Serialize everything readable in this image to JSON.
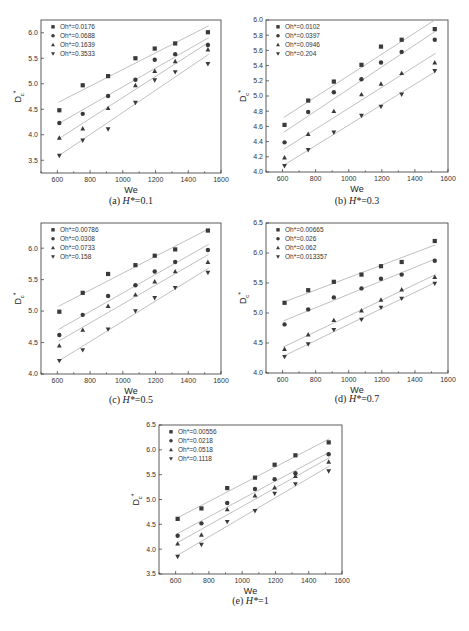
{
  "chart_data": [
    {
      "type": "scatter",
      "panel": "a",
      "caption_prefix": "(a)",
      "caption_var": "H*",
      "caption_value": "=0.1",
      "xlabel": "We",
      "ylabel_main": "D",
      "ylabel_sub": "c",
      "ylabel_sup": "*",
      "xlim": [
        500,
        1600
      ],
      "ylim": [
        3.25,
        6.25
      ],
      "xticks": [
        600,
        800,
        1000,
        1200,
        1400,
        1600
      ],
      "yticks": [
        3.5,
        4.0,
        4.5,
        5.0,
        5.5,
        6.0
      ],
      "ytick_labels": [
        "3.5",
        "4.0",
        "4.5",
        "5.0",
        "5.5",
        "6.0"
      ],
      "legend_position": "top-left",
      "x": [
        612,
        755,
        910,
        1077,
        1195,
        1320,
        1520
      ],
      "series": [
        {
          "name": "Oh*=0.0176",
          "marker": "square",
          "values": [
            4.48,
            4.97,
            5.15,
            5.5,
            5.69,
            5.79,
            6.01
          ]
        },
        {
          "name": "Oh*=0.0688",
          "marker": "circle",
          "values": [
            4.23,
            4.41,
            4.76,
            5.08,
            5.47,
            5.58,
            5.76
          ]
        },
        {
          "name": "Oh*=0.1639",
          "marker": "triangle-up",
          "values": [
            3.94,
            4.12,
            4.52,
            4.97,
            5.25,
            5.44,
            5.67
          ]
        },
        {
          "name": "Oh*=0.3533",
          "marker": "triangle-down",
          "values": [
            3.59,
            3.89,
            4.11,
            4.63,
            5.07,
            5.23,
            5.39
          ]
        }
      ]
    },
    {
      "type": "scatter",
      "panel": "b",
      "caption_prefix": "(b)",
      "caption_var": "H*",
      "caption_value": "=0.3",
      "xlabel": "We",
      "ylabel_main": "D",
      "ylabel_sub": "c",
      "ylabel_sup": "*",
      "xlim": [
        500,
        1600
      ],
      "ylim": [
        4.0,
        6.0
      ],
      "xticks": [
        600,
        800,
        1000,
        1200,
        1400,
        1600
      ],
      "yticks": [
        4.0,
        4.2,
        4.4,
        4.6,
        4.8,
        5.0,
        5.2,
        5.4,
        5.6,
        5.8,
        6.0
      ],
      "ytick_labels": [
        "4.0",
        "4.2",
        "4.4",
        "4.6",
        "4.8",
        "5.0",
        "5.2",
        "5.4",
        "5.6",
        "5.8",
        "6.0"
      ],
      "legend_position": "top-left",
      "x": [
        612,
        755,
        910,
        1077,
        1195,
        1320,
        1520
      ],
      "series": [
        {
          "name": "Oh*=0.0102",
          "marker": "square",
          "values": [
            4.62,
            4.94,
            5.19,
            5.41,
            5.65,
            5.74,
            5.88
          ]
        },
        {
          "name": "Oh*=0.0397",
          "marker": "circle",
          "values": [
            4.39,
            4.79,
            5.05,
            5.22,
            5.44,
            5.58,
            5.74
          ]
        },
        {
          "name": "Oh*=0.0946",
          "marker": "triangle-up",
          "values": [
            4.19,
            4.5,
            4.8,
            5.02,
            5.16,
            5.3,
            5.44
          ]
        },
        {
          "name": "Oh*=0.204",
          "marker": "triangle-down",
          "values": [
            4.08,
            4.29,
            4.52,
            4.74,
            4.86,
            5.02,
            5.33
          ]
        }
      ]
    },
    {
      "type": "scatter",
      "panel": "c",
      "caption_prefix": "(c)",
      "caption_var": "H*",
      "caption_value": "=0.5",
      "xlabel": "We",
      "ylabel_main": "D",
      "ylabel_sub": "c",
      "ylabel_sup": "*",
      "xlim": [
        500,
        1600
      ],
      "ylim": [
        4.0,
        6.4
      ],
      "xticks": [
        600,
        800,
        1000,
        1200,
        1400,
        1600
      ],
      "yticks": [
        4.0,
        4.5,
        5.0,
        5.5,
        6.0
      ],
      "ytick_labels": [
        "4.0",
        "4.5",
        "5.0",
        "5.5",
        "6.0"
      ],
      "legend_position": "top-left",
      "x": [
        612,
        755,
        910,
        1077,
        1195,
        1320,
        1520
      ],
      "series": [
        {
          "name": "Oh*=0.00786",
          "marker": "square",
          "values": [
            4.99,
            5.29,
            5.59,
            5.73,
            5.88,
            5.98,
            6.28
          ]
        },
        {
          "name": "Oh*=0.0308",
          "marker": "circle",
          "values": [
            4.62,
            4.94,
            5.24,
            5.41,
            5.63,
            5.78,
            5.97
          ]
        },
        {
          "name": "Oh*=0.0733",
          "marker": "triangle-up",
          "values": [
            4.45,
            4.7,
            5.08,
            5.26,
            5.47,
            5.63,
            5.78
          ]
        },
        {
          "name": "Oh*=0.158",
          "marker": "triangle-down",
          "values": [
            4.21,
            4.38,
            4.71,
            5.0,
            5.21,
            5.37,
            5.61
          ]
        }
      ]
    },
    {
      "type": "scatter",
      "panel": "d",
      "caption_prefix": "(d)",
      "caption_var": "H*",
      "caption_value": "=0.7",
      "xlabel": "We",
      "ylabel_main": "D",
      "ylabel_sub": "c",
      "ylabel_sup": "*",
      "xlim": [
        500,
        1600
      ],
      "ylim": [
        4.0,
        6.5
      ],
      "xticks": [
        600,
        800,
        1000,
        1200,
        1400,
        1600
      ],
      "yticks": [
        4.0,
        4.5,
        5.0,
        5.5,
        6.0,
        6.5
      ],
      "ytick_labels": [
        "4.0",
        "4.5",
        "5.0",
        "5.5",
        "6.0",
        "6.5"
      ],
      "legend_position": "top-left",
      "x": [
        612,
        755,
        910,
        1077,
        1195,
        1320,
        1520
      ],
      "series": [
        {
          "name": "Oh*=0.00665",
          "marker": "square",
          "values": [
            5.17,
            5.38,
            5.52,
            5.64,
            5.78,
            5.85,
            6.2
          ]
        },
        {
          "name": "Oh*=0.026",
          "marker": "circle",
          "values": [
            4.81,
            5.06,
            5.26,
            5.41,
            5.57,
            5.64,
            5.87
          ]
        },
        {
          "name": "Oh*=0.062",
          "marker": "triangle-up",
          "values": [
            4.4,
            4.64,
            4.88,
            5.04,
            5.22,
            5.39,
            5.6
          ]
        },
        {
          "name": "Oh*=0.013357",
          "marker": "triangle-down",
          "values": [
            4.27,
            4.48,
            4.72,
            4.89,
            5.09,
            5.24,
            5.49
          ]
        }
      ]
    },
    {
      "type": "scatter",
      "panel": "e",
      "caption_prefix": "(e)",
      "caption_var": "H*",
      "caption_value": "=1",
      "xlabel": "We",
      "ylabel_main": "D",
      "ylabel_sub": "c",
      "ylabel_sup": "*",
      "xlim": [
        500,
        1600
      ],
      "ylim": [
        3.5,
        6.5
      ],
      "xticks": [
        600,
        800,
        1000,
        1200,
        1400,
        1600
      ],
      "yticks": [
        3.5,
        4.0,
        4.5,
        5.0,
        5.5,
        6.0,
        6.5
      ],
      "ytick_labels": [
        "3.5",
        "4.0",
        "4.5",
        "5.0",
        "5.5",
        "6.0",
        "6.5"
      ],
      "legend_position": "top-left",
      "x": [
        612,
        755,
        910,
        1077,
        1195,
        1320,
        1520
      ],
      "series": [
        {
          "name": "Oh*=0.00556",
          "marker": "square",
          "values": [
            4.61,
            4.82,
            5.23,
            5.44,
            5.7,
            5.89,
            6.15
          ]
        },
        {
          "name": "Oh*=0.0218",
          "marker": "circle",
          "values": [
            4.27,
            4.52,
            4.93,
            5.21,
            5.41,
            5.53,
            5.91
          ]
        },
        {
          "name": "Oh*=0.0518",
          "marker": "triangle-up",
          "values": [
            4.11,
            4.29,
            4.8,
            5.08,
            5.24,
            5.47,
            5.76
          ]
        },
        {
          "name": "Oh*=0.1118",
          "marker": "triangle-down",
          "values": [
            3.85,
            4.09,
            4.55,
            4.77,
            5.12,
            5.31,
            5.57
          ]
        }
      ]
    }
  ],
  "colors": {
    "marker": "#3a3a3a",
    "fit_line": "#b0b0b0",
    "axis": "#333333"
  }
}
